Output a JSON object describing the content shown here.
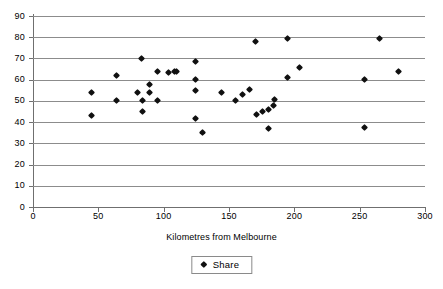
{
  "chart_data": {
    "type": "scatter",
    "title": "",
    "xlabel": "Kilometres from Melbourne",
    "ylabel": "",
    "xlim": [
      0,
      300
    ],
    "ylim": [
      0,
      90
    ],
    "xticks": [
      0,
      50,
      100,
      150,
      200,
      250,
      300
    ],
    "yticks": [
      0,
      10,
      20,
      30,
      40,
      50,
      60,
      70,
      80,
      90
    ],
    "grid": "horizontal",
    "legend": {
      "position": "bottom-center",
      "entries": [
        {
          "name": "Share",
          "marker": "diamond",
          "color": "#101010"
        }
      ]
    },
    "series": [
      {
        "name": "Share",
        "marker": "diamond",
        "color": "#101010",
        "points": [
          {
            "x": 45,
            "y": 54
          },
          {
            "x": 45,
            "y": 43
          },
          {
            "x": 64,
            "y": 62
          },
          {
            "x": 64,
            "y": 50
          },
          {
            "x": 80,
            "y": 54
          },
          {
            "x": 83,
            "y": 70
          },
          {
            "x": 84,
            "y": 50
          },
          {
            "x": 84,
            "y": 45
          },
          {
            "x": 89,
            "y": 57.5
          },
          {
            "x": 89,
            "y": 54
          },
          {
            "x": 95,
            "y": 64
          },
          {
            "x": 95,
            "y": 50
          },
          {
            "x": 104,
            "y": 63.5
          },
          {
            "x": 108,
            "y": 64
          },
          {
            "x": 110,
            "y": 64
          },
          {
            "x": 124,
            "y": 68.5
          },
          {
            "x": 124,
            "y": 60
          },
          {
            "x": 124,
            "y": 55
          },
          {
            "x": 124,
            "y": 41.5
          },
          {
            "x": 130,
            "y": 35
          },
          {
            "x": 144,
            "y": 54
          },
          {
            "x": 155,
            "y": 50
          },
          {
            "x": 160,
            "y": 53
          },
          {
            "x": 166,
            "y": 55.5
          },
          {
            "x": 170,
            "y": 78
          },
          {
            "x": 171,
            "y": 43.5
          },
          {
            "x": 176,
            "y": 45
          },
          {
            "x": 180,
            "y": 46
          },
          {
            "x": 180,
            "y": 37
          },
          {
            "x": 184,
            "y": 48
          },
          {
            "x": 185,
            "y": 50.5
          },
          {
            "x": 195,
            "y": 79.5
          },
          {
            "x": 195,
            "y": 61
          },
          {
            "x": 204,
            "y": 65.5
          },
          {
            "x": 254,
            "y": 60
          },
          {
            "x": 254,
            "y": 37.5
          },
          {
            "x": 265,
            "y": 79.5
          },
          {
            "x": 280,
            "y": 64
          }
        ]
      }
    ]
  }
}
